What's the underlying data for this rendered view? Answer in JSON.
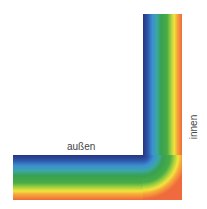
{
  "diagram": {
    "type": "thermal-wall-corner",
    "labels": {
      "outside": "außen",
      "inside": "innen"
    },
    "gradient_stops": [
      {
        "offset": "0%",
        "color": "#27357f"
      },
      {
        "offset": "12%",
        "color": "#2e55a8"
      },
      {
        "offset": "24%",
        "color": "#3d8fd4"
      },
      {
        "offset": "36%",
        "color": "#3aa8a0"
      },
      {
        "offset": "46%",
        "color": "#39a050"
      },
      {
        "offset": "62%",
        "color": "#48ad45"
      },
      {
        "offset": "72%",
        "color": "#a8d040"
      },
      {
        "offset": "80%",
        "color": "#f2e43c"
      },
      {
        "offset": "88%",
        "color": "#f6a53a"
      },
      {
        "offset": "100%",
        "color": "#ef6a3c"
      }
    ]
  }
}
